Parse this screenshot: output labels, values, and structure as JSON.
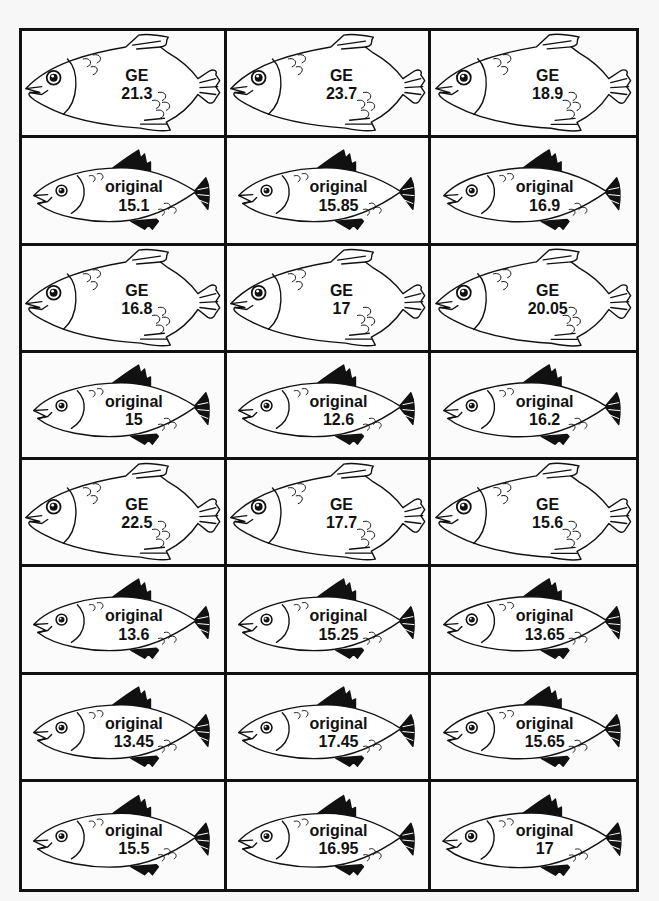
{
  "worksheet": {
    "cards": [
      {
        "type": "ge",
        "label": "GE",
        "value": "21.3"
      },
      {
        "type": "ge",
        "label": "GE",
        "value": "23.7"
      },
      {
        "type": "ge",
        "label": "GE",
        "value": "18.9"
      },
      {
        "type": "original",
        "label": "original",
        "value": "15.1"
      },
      {
        "type": "original",
        "label": "original",
        "value": "15.85"
      },
      {
        "type": "original",
        "label": "original",
        "value": "16.9"
      },
      {
        "type": "ge",
        "label": "GE",
        "value": "16.8"
      },
      {
        "type": "ge",
        "label": "GE",
        "value": "17"
      },
      {
        "type": "ge",
        "label": "GE",
        "value": "20.05"
      },
      {
        "type": "original",
        "label": "original",
        "value": "15"
      },
      {
        "type": "original",
        "label": "original",
        "value": "12.6"
      },
      {
        "type": "original",
        "label": "original",
        "value": "16.2"
      },
      {
        "type": "ge",
        "label": "GE",
        "value": "22.5"
      },
      {
        "type": "ge",
        "label": "GE",
        "value": "17.7"
      },
      {
        "type": "ge",
        "label": "GE",
        "value": "15.6"
      },
      {
        "type": "original",
        "label": "original",
        "value": "13.6"
      },
      {
        "type": "original",
        "label": "original",
        "value": "15.25"
      },
      {
        "type": "original",
        "label": "original",
        "value": "13.65"
      },
      {
        "type": "original",
        "label": "original",
        "value": "13.45"
      },
      {
        "type": "original",
        "label": "original",
        "value": "17.45"
      },
      {
        "type": "original",
        "label": "original",
        "value": "15.65"
      },
      {
        "type": "original",
        "label": "original",
        "value": "15.5"
      },
      {
        "type": "original",
        "label": "original",
        "value": "16.95"
      },
      {
        "type": "original",
        "label": "original",
        "value": "17"
      }
    ],
    "icons": {
      "ge": "large-fish-outline-icon",
      "original": "small-fish-black-fins-icon"
    },
    "colors": {
      "line": "#111111",
      "background": "#fbfbfb"
    }
  }
}
